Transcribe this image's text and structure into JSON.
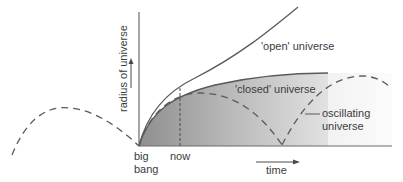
{
  "diagram": {
    "title": "",
    "axes": {
      "y_label": "radius of universe",
      "x_label": "time"
    },
    "labels": {
      "origin_line1": "big",
      "origin_line2": "bang",
      "now": "now",
      "open": "'open' universe",
      "closed": "'closed' universe",
      "oscillating_line1": "oscillating",
      "oscillating_line2": "universe"
    },
    "curves": [
      {
        "name": "open universe",
        "style": "solid"
      },
      {
        "name": "closed universe",
        "style": "solid",
        "fill": "shaded gradient"
      },
      {
        "name": "oscillating universe",
        "style": "dashed"
      }
    ],
    "colors": {
      "line": "#5a5a5a",
      "shade_dark": "#9a9a9a",
      "shade_light": "#f4f4f4"
    }
  }
}
